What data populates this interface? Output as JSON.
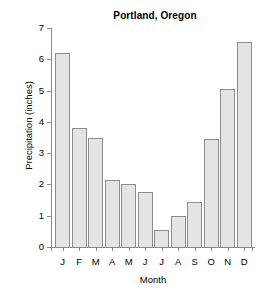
{
  "chart_data": {
    "type": "bar",
    "title": "Portland, Oregon",
    "xlabel": "Month",
    "ylabel": "Precipitation (inches)",
    "categories": [
      "J",
      "F",
      "M",
      "A",
      "M",
      "J",
      "J",
      "A",
      "S",
      "O",
      "N",
      "D"
    ],
    "category_names": [
      "January",
      "February",
      "March",
      "April",
      "May",
      "June",
      "July",
      "August",
      "September",
      "October",
      "November",
      "December"
    ],
    "values": [
      6.2,
      3.8,
      3.5,
      2.15,
      2.0,
      1.75,
      0.55,
      1.0,
      1.45,
      3.45,
      5.05,
      6.55
    ],
    "ylim": [
      0,
      7
    ],
    "yticks": [
      0,
      1,
      2,
      3,
      4,
      5,
      6,
      7
    ],
    "ytick_labels": [
      "0",
      "1",
      "2",
      "3",
      "4",
      "5",
      "6",
      "7"
    ],
    "grid": false,
    "legend": null,
    "bar_fill_color": "#e4e4e4",
    "bar_edge_color": "#8c8c8c",
    "axis_color": "#8a8a8a",
    "background_color": "#ffffff"
  }
}
